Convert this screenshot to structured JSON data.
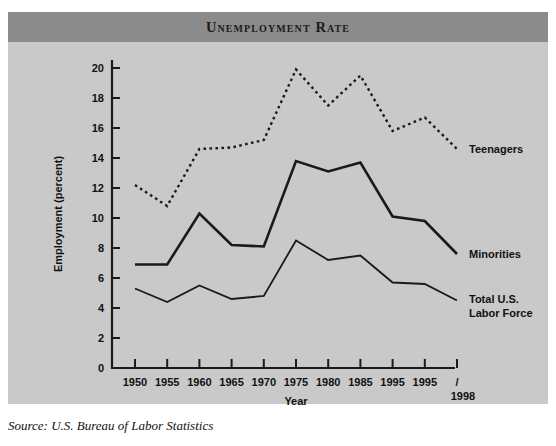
{
  "figure": {
    "title": "Unemployment Rate",
    "source_note": "Source: U.S. Bureau of Labor Statistics",
    "banner_color": "#8b8b8b",
    "panel_color": "#c9c9c9",
    "line_color": "#1a1a1a"
  },
  "chart_data": {
    "type": "line",
    "title": "Unemployment Rate",
    "xlabel": "Year",
    "ylabel": "Employment (percent)",
    "x": [
      1950,
      1955,
      1960,
      1965,
      1970,
      1975,
      1980,
      1985,
      1995,
      1995,
      1998
    ],
    "xtick_labels": [
      "1950",
      "1955",
      "1960",
      "1965",
      "1970",
      "1975",
      "1980",
      "1985",
      "1995",
      "1995",
      "1998"
    ],
    "ytick_labels": [
      "0",
      "2",
      "4",
      "6",
      "8",
      "10",
      "12",
      "14",
      "16",
      "18",
      "20"
    ],
    "ytick_values": [
      0,
      2,
      4,
      6,
      8,
      10,
      12,
      14,
      16,
      18,
      20
    ],
    "ylim": [
      0,
      21
    ],
    "grid": false,
    "legend_position": "right-inline",
    "end_tick_marker": "/",
    "end_tick_label": "1998",
    "series": [
      {
        "name": "Teenagers",
        "style": "dotted",
        "values": [
          12.2,
          10.8,
          14.6,
          14.7,
          15.2,
          19.9,
          17.5,
          19.5,
          15.8,
          16.7,
          14.6
        ]
      },
      {
        "name": "Minorities",
        "style": "solid-thick",
        "values": [
          6.9,
          6.9,
          10.3,
          8.2,
          8.1,
          13.8,
          13.1,
          13.7,
          10.1,
          9.8,
          7.6
        ]
      },
      {
        "name": "Total U.S. Labor Force",
        "style": "solid-thin",
        "values": [
          5.3,
          4.4,
          5.5,
          4.6,
          4.8,
          8.5,
          7.2,
          7.5,
          5.7,
          5.6,
          4.5
        ]
      }
    ]
  },
  "series_labels": {
    "teenagers": "Teenagers",
    "minorities": "Minorities",
    "total_line1": "Total U.S.",
    "total_line2": "Labor Force"
  }
}
